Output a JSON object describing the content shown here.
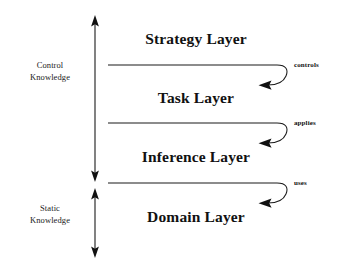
{
  "diagram": {
    "background_color": "#ffffff",
    "stroke_color": "#1a1a1a",
    "text_color": "#111111",
    "knowledge_groups": [
      {
        "id": "control-knowledge",
        "line1": "Control",
        "line2": "Knowledge",
        "covers": [
          "Strategy Layer",
          "Task Layer",
          "Inference Layer"
        ]
      },
      {
        "id": "static-knowledge",
        "line1": "Static",
        "line2": "Knowledge",
        "covers": [
          "Domain Layer"
        ]
      }
    ],
    "layers": [
      {
        "id": "strategy-layer",
        "label": "Strategy Layer"
      },
      {
        "id": "task-layer",
        "label": "Task Layer"
      },
      {
        "id": "inference-layer",
        "label": "Inference Layer"
      },
      {
        "id": "domain-layer",
        "label": "Domain Layer"
      }
    ],
    "relations": [
      {
        "id": "controls",
        "label": "controls",
        "from": "Strategy Layer",
        "to": "Task Layer"
      },
      {
        "id": "applies",
        "label": "applies",
        "from": "Task Layer",
        "to": "Inference Layer"
      },
      {
        "id": "uses",
        "label": "uses",
        "from": "Inference Layer",
        "to": "Domain Layer"
      }
    ]
  }
}
